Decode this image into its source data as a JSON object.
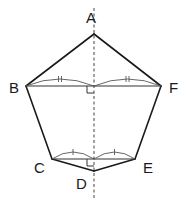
{
  "figure": {
    "type": "pentagon-symmetry-diagram",
    "polygon_order": [
      "A",
      "B",
      "C",
      "D",
      "E",
      "F"
    ],
    "vertices": {
      "A": {
        "label": "A"
      },
      "B": {
        "label": "B"
      },
      "C": {
        "label": "C"
      },
      "D": {
        "label": "D"
      },
      "E": {
        "label": "E"
      },
      "F": {
        "label": "F"
      }
    },
    "segments": [
      {
        "from": "B",
        "to": "F",
        "style": "solid",
        "note": "bisected by axis of symmetry"
      },
      {
        "from": "C",
        "to": "E",
        "style": "solid",
        "note": "bisected by axis of symmetry"
      }
    ],
    "axis_of_symmetry": {
      "through": [
        "A",
        "D"
      ],
      "style": "dashed"
    },
    "equal_marks": [
      {
        "segment_halves_of": "BF",
        "mark": "double-tick"
      },
      {
        "segment_halves_of": "CE",
        "mark": "single-tick"
      }
    ],
    "right_angles": [
      {
        "at": "BF ∩ axis"
      },
      {
        "at": "CE ∩ axis"
      }
    ],
    "colors": {
      "line": "#1a1a1a",
      "background": "#ffffff"
    }
  }
}
